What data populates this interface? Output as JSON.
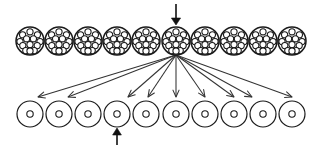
{
  "figure": {
    "type": "schematic-diagram",
    "title": "",
    "canvas": {
      "width": 317,
      "height": 148,
      "background": "#ffffff"
    },
    "stroke_color": "#1a1a1a",
    "arrow_color": "#333333",
    "emphasis_arrow_color": "#111111"
  },
  "top_row": {
    "name": "multi-particle-clusters",
    "count": 10,
    "center_y": 41,
    "radius": 14,
    "centers_x": [
      30,
      59,
      88,
      117,
      146,
      176,
      205,
      234,
      263,
      292
    ],
    "inner_dot_radius": 3.1,
    "inner_dot_count": 13,
    "inner_dots_rel": [
      [
        0,
        -9.2
      ],
      [
        -7.4,
        -6.2
      ],
      [
        7.4,
        -6.2
      ],
      [
        -10.0,
        0.6
      ],
      [
        -3.4,
        -2.2
      ],
      [
        3.4,
        -2.2
      ],
      [
        10.0,
        0.6
      ],
      [
        -7.2,
        4.6
      ],
      [
        0,
        3.6
      ],
      [
        7.2,
        4.6
      ],
      [
        -4.2,
        9.6
      ],
      [
        4.2,
        9.6
      ],
      [
        0,
        10.0
      ]
    ]
  },
  "bottom_row": {
    "name": "single-particle-circles",
    "count": 10,
    "center_y": 114,
    "radius": 13,
    "centers_x": [
      30,
      59,
      88,
      117,
      146,
      176,
      205,
      234,
      263,
      292
    ],
    "inner_dot_radius": 3.2
  },
  "input_arrow": {
    "name": "top-input-arrow",
    "direction": "down",
    "x": 176,
    "y_start": 4,
    "y_end": 25,
    "target_index": 5,
    "color": "#111111"
  },
  "output_arrow": {
    "name": "bottom-output-arrow",
    "direction": "up",
    "x": 117,
    "y_start": 145,
    "y_end": 128,
    "target_index": 3,
    "color": "#111111"
  },
  "fan_arrows": {
    "name": "dispersal-arrows",
    "count": 9,
    "source_index": 5,
    "source_x": 176,
    "source_y": 55,
    "targets_x": [
      38,
      68,
      128,
      148,
      176,
      205,
      234,
      252,
      292
    ],
    "target_y": 97,
    "color": "#333333"
  }
}
